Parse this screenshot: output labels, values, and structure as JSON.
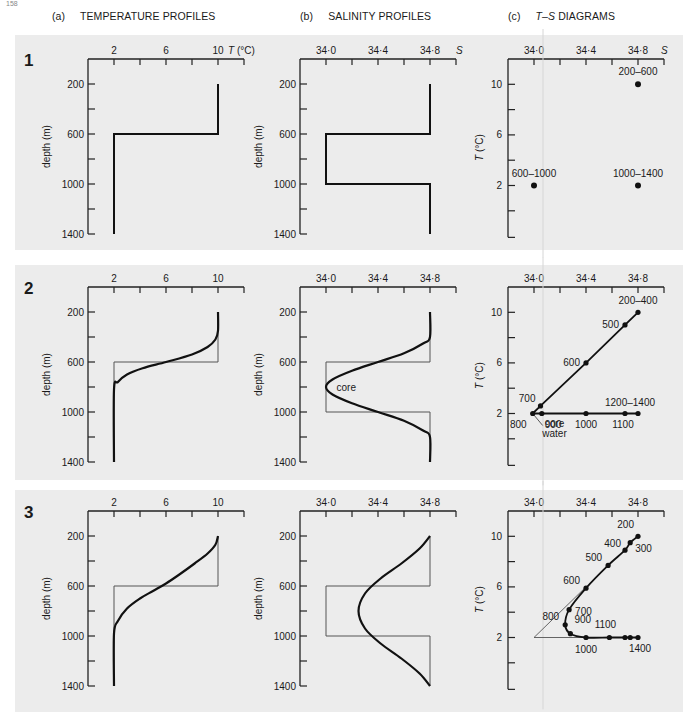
{
  "page": {
    "number": "158"
  },
  "headers": [
    {
      "tag": "(a)",
      "title": "TEMPERATURE PROFILES",
      "italic": ""
    },
    {
      "tag": "(b)",
      "title": "SALINITY PROFILES",
      "italic": ""
    },
    {
      "tag": "(c)",
      "title": "DIAGRAMS",
      "italic": "T–S"
    }
  ],
  "axes": {
    "temperature": {
      "ticks": [
        2,
        6,
        10
      ],
      "minor_ticks": [
        0,
        4,
        8,
        12
      ],
      "label": "T (°C)",
      "range": [
        0,
        12
      ]
    },
    "salinity": {
      "ticks": [
        "34·0",
        "34·4",
        "34·8"
      ],
      "tick_values": [
        34.0,
        34.4,
        34.8
      ],
      "minor_ticks": [
        33.8,
        34.2,
        34.6,
        35.0
      ],
      "label": "S",
      "range": [
        33.8,
        35.0
      ]
    },
    "depth": {
      "ticks": [
        200,
        600,
        1000,
        1400
      ],
      "minor_ticks": [
        400,
        800,
        1200
      ],
      "label": "depth (m)",
      "range": [
        0,
        1400
      ]
    },
    "ts_temperature": {
      "ticks": [
        2,
        6,
        10
      ],
      "minor_ticks": [
        0,
        4,
        8
      ],
      "label": "T (°C)",
      "range": [
        -1,
        12
      ]
    }
  },
  "rows": [
    {
      "label": "1"
    },
    {
      "label": "2"
    },
    {
      "label": "3"
    }
  ],
  "chart_data": [
    {
      "type": "line",
      "panel": "1a",
      "title": "TEMPERATURE PROFILES",
      "xlabel": "T (°C)",
      "ylabel": "depth (m)",
      "xlim": [
        0,
        12
      ],
      "ylim": [
        1400,
        0
      ],
      "series": [
        {
          "name": "temperature",
          "points": [
            [
              10,
              200
            ],
            [
              10,
              600
            ],
            [
              2,
              600
            ],
            [
              2,
              1400
            ]
          ]
        }
      ]
    },
    {
      "type": "line",
      "panel": "1b",
      "title": "SALINITY PROFILES",
      "xlabel": "S",
      "ylabel": "depth (m)",
      "xlim": [
        33.8,
        35.0
      ],
      "ylim": [
        1400,
        0
      ],
      "series": [
        {
          "name": "salinity",
          "points": [
            [
              34.8,
              200
            ],
            [
              34.8,
              600
            ],
            [
              34.0,
              600
            ],
            [
              34.0,
              1000
            ],
            [
              34.8,
              1000
            ],
            [
              34.8,
              1400
            ]
          ]
        }
      ]
    },
    {
      "type": "scatter",
      "panel": "1c",
      "title": "T–S DIAGRAMS",
      "xlabel": "S",
      "ylabel": "T (°C)",
      "points": [
        {
          "s": 34.8,
          "t": 10,
          "label": "200–600"
        },
        {
          "s": 34.0,
          "t": 2,
          "label": "600–1000"
        },
        {
          "s": 34.8,
          "t": 2,
          "label": "1000–1400"
        }
      ]
    },
    {
      "type": "line",
      "panel": "2a",
      "xlabel": "T (°C)",
      "ylabel": "depth (m)",
      "series": [
        {
          "name": "original step profile",
          "style": "thin",
          "points": [
            [
              10,
              200
            ],
            [
              10,
              600
            ],
            [
              2,
              600
            ],
            [
              2,
              1400
            ]
          ]
        },
        {
          "name": "mixed profile",
          "style": "thick",
          "points": [
            [
              10,
              200
            ],
            [
              10,
              350
            ],
            [
              9.8,
              420
            ],
            [
              9.2,
              480
            ],
            [
              8,
              540
            ],
            [
              6,
              600
            ],
            [
              4.2,
              650
            ],
            [
              3,
              700
            ],
            [
              2.3,
              760
            ],
            [
              2,
              820
            ],
            [
              2,
              1400
            ]
          ]
        }
      ]
    },
    {
      "type": "line",
      "panel": "2b",
      "xlabel": "S",
      "ylabel": "depth (m)",
      "annotations": [
        {
          "text": "core",
          "s": 34.05,
          "depth": 800
        }
      ],
      "series": [
        {
          "name": "original step profile",
          "style": "thin",
          "points": [
            [
              34.8,
              200
            ],
            [
              34.8,
              600
            ],
            [
              34.0,
              600
            ],
            [
              34.0,
              1000
            ],
            [
              34.8,
              1000
            ],
            [
              34.8,
              1400
            ]
          ]
        },
        {
          "name": "mixed profile",
          "style": "thick",
          "points": [
            [
              34.8,
              200
            ],
            [
              34.8,
              400
            ],
            [
              34.75,
              450
            ],
            [
              34.6,
              530
            ],
            [
              34.4,
              600
            ],
            [
              34.2,
              670
            ],
            [
              34.05,
              740
            ],
            [
              34.0,
              800
            ],
            [
              34.05,
              860
            ],
            [
              34.2,
              930
            ],
            [
              34.4,
              1000
            ],
            [
              34.6,
              1070
            ],
            [
              34.75,
              1150
            ],
            [
              34.8,
              1200
            ],
            [
              34.8,
              1400
            ]
          ]
        }
      ]
    },
    {
      "type": "line",
      "panel": "2c",
      "xlabel": "S",
      "ylabel": "T (°C)",
      "annotations": [
        {
          "text": "core water",
          "s": 34.05,
          "t": 1.2
        }
      ],
      "points": [
        {
          "s": 34.8,
          "t": 10,
          "label": "200–400"
        },
        {
          "s": 34.7,
          "t": 9,
          "label": "500"
        },
        {
          "s": 34.4,
          "t": 6,
          "label": "600"
        },
        {
          "s": 34.05,
          "t": 2.6,
          "label": "700"
        },
        {
          "s": 33.99,
          "t": 2,
          "label": "800"
        },
        {
          "s": 34.06,
          "t": 2,
          "label": "900"
        },
        {
          "s": 34.4,
          "t": 2,
          "label": "1000"
        },
        {
          "s": 34.7,
          "t": 2,
          "label": "1100"
        },
        {
          "s": 34.8,
          "t": 2,
          "label": "1200–1400"
        }
      ]
    },
    {
      "type": "line",
      "panel": "3a",
      "xlabel": "T (°C)",
      "ylabel": "depth (m)",
      "series": [
        {
          "name": "original step profile",
          "style": "thin",
          "points": [
            [
              10,
              200
            ],
            [
              10,
              600
            ],
            [
              2,
              600
            ],
            [
              2,
              1400
            ]
          ]
        },
        {
          "name": "mixed profile",
          "style": "thick",
          "points": [
            [
              10,
              200
            ],
            [
              9.8,
              270
            ],
            [
              9.2,
              340
            ],
            [
              8.2,
              420
            ],
            [
              7,
              510
            ],
            [
              6,
              580
            ],
            [
              5,
              640
            ],
            [
              4,
              700
            ],
            [
              3,
              780
            ],
            [
              2.3,
              880
            ],
            [
              2,
              980
            ],
            [
              2,
              1400
            ]
          ]
        }
      ]
    },
    {
      "type": "line",
      "panel": "3b",
      "xlabel": "S",
      "ylabel": "depth (m)",
      "series": [
        {
          "name": "original step profile",
          "style": "thin",
          "points": [
            [
              34.8,
              200
            ],
            [
              34.8,
              600
            ],
            [
              34.0,
              600
            ],
            [
              34.0,
              1000
            ],
            [
              34.8,
              1000
            ],
            [
              34.8,
              1400
            ]
          ]
        },
        {
          "name": "mixed profile",
          "style": "thick",
          "points": [
            [
              34.8,
              200
            ],
            [
              34.72,
              300
            ],
            [
              34.58,
              420
            ],
            [
              34.42,
              540
            ],
            [
              34.3,
              660
            ],
            [
              34.25,
              800
            ],
            [
              34.3,
              940
            ],
            [
              34.42,
              1060
            ],
            [
              34.58,
              1180
            ],
            [
              34.72,
              1300
            ],
            [
              34.8,
              1400
            ]
          ]
        }
      ]
    },
    {
      "type": "line",
      "panel": "3c",
      "xlabel": "S",
      "ylabel": "T (°C)",
      "points": [
        {
          "s": 34.8,
          "t": 10,
          "label": "200"
        },
        {
          "s": 34.74,
          "t": 9.5,
          "label": "300"
        },
        {
          "s": 34.7,
          "t": 8.9,
          "label": "400"
        },
        {
          "s": 34.57,
          "t": 7.7,
          "label": "500"
        },
        {
          "s": 34.4,
          "t": 5.9,
          "label": "600"
        },
        {
          "s": 34.27,
          "t": 4.2,
          "label": "700"
        },
        {
          "s": 34.24,
          "t": 3.0,
          "label": "800"
        },
        {
          "s": 34.28,
          "t": 2.3,
          "label": "900"
        },
        {
          "s": 34.4,
          "t": 2.0,
          "label": "1000"
        },
        {
          "s": 34.58,
          "t": 2.0,
          "label": "1100"
        },
        {
          "s": 34.7,
          "t": 2.0,
          "label": ""
        },
        {
          "s": 34.74,
          "t": 2.0,
          "label": ""
        },
        {
          "s": 34.8,
          "t": 2.0,
          "label": "1400"
        }
      ],
      "reference_lines": [
        [
          [
            34.4,
            6
          ],
          [
            34.0,
            2
          ],
          [
            34.4,
            2
          ]
        ]
      ]
    }
  ]
}
